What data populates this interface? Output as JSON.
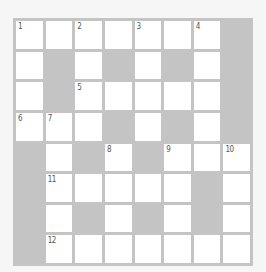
{
  "puzzle": {
    "rows": 8,
    "cols": 8,
    "colors": {
      "background": "#f6f6f6",
      "block": "#c4c4c4",
      "gridline": "#c4c4c4",
      "cell": "#ffffff",
      "number": "#555555"
    },
    "grid": [
      [
        "W",
        "W",
        "W",
        "W",
        "W",
        "W",
        "W",
        "B"
      ],
      [
        "W",
        "B",
        "W",
        "B",
        "W",
        "B",
        "W",
        "B"
      ],
      [
        "W",
        "B",
        "W",
        "W",
        "W",
        "W",
        "W",
        "B"
      ],
      [
        "W",
        "W",
        "W",
        "B",
        "W",
        "B",
        "W",
        "B"
      ],
      [
        "B",
        "W",
        "B",
        "W",
        "B",
        "W",
        "W",
        "W"
      ],
      [
        "B",
        "W",
        "W",
        "W",
        "W",
        "W",
        "B",
        "W"
      ],
      [
        "B",
        "W",
        "B",
        "W",
        "B",
        "W",
        "B",
        "W"
      ],
      [
        "B",
        "W",
        "W",
        "W",
        "W",
        "W",
        "W",
        "W"
      ]
    ],
    "numbers": {
      "0,0": "1",
      "0,2": "2",
      "0,4": "3",
      "0,6": "4",
      "2,2": "5",
      "3,0": "6",
      "3,1": "7",
      "4,3": "8",
      "4,5": "9",
      "4,7": "10",
      "5,1": "11",
      "7,1": "12"
    }
  }
}
